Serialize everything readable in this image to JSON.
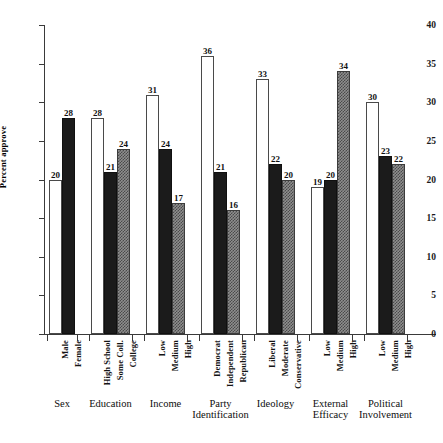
{
  "chart_data": {
    "type": "bar",
    "title": "",
    "xlabel": "",
    "ylabel": "Percent approve",
    "ylim": [
      0,
      40
    ],
    "ytick_labels": [
      "0",
      "5",
      "10",
      "15",
      "20",
      "25",
      "30",
      "35",
      "40"
    ],
    "ytick_values": [
      0,
      5,
      10,
      15,
      20,
      25,
      30,
      35,
      40
    ],
    "grid": false,
    "legend": "none",
    "bar_styles": [
      "white",
      "black",
      "gray"
    ],
    "groups": [
      {
        "name": "Sex",
        "title_lines": [
          "Sex"
        ],
        "categories": [
          "Male",
          "Female"
        ],
        "values": [
          20,
          28
        ],
        "styles": [
          "white",
          "black"
        ]
      },
      {
        "name": "Education",
        "title_lines": [
          "Education"
        ],
        "categories": [
          "High School",
          "Some Coll.",
          "College"
        ],
        "values": [
          28,
          21,
          24
        ],
        "styles": [
          "white",
          "black",
          "gray"
        ]
      },
      {
        "name": "Income",
        "title_lines": [
          "Income"
        ],
        "categories": [
          "Low",
          "Medium",
          "High"
        ],
        "values": [
          31,
          24,
          17
        ],
        "styles": [
          "white",
          "black",
          "gray"
        ]
      },
      {
        "name": "Party Identification",
        "title_lines": [
          "Party",
          "Identification"
        ],
        "categories": [
          "Democrat",
          "Independent",
          "Republican"
        ],
        "values": [
          36,
          21,
          16
        ],
        "styles": [
          "white",
          "black",
          "gray"
        ]
      },
      {
        "name": "Ideology",
        "title_lines": [
          "Ideology"
        ],
        "categories": [
          "Liberal",
          "Moderate",
          "Conservative"
        ],
        "values": [
          33,
          22,
          20
        ],
        "styles": [
          "white",
          "black",
          "gray"
        ]
      },
      {
        "name": "External Efficacy",
        "title_lines": [
          "External",
          "Efficacy"
        ],
        "categories": [
          "Low",
          "Medium",
          "High"
        ],
        "values": [
          19,
          20,
          34
        ],
        "styles": [
          "white",
          "black",
          "gray"
        ]
      },
      {
        "name": "Political Involvement",
        "title_lines": [
          "Political",
          "Involvement"
        ],
        "categories": [
          "Low",
          "Medium",
          "High"
        ],
        "values": [
          30,
          23,
          22
        ],
        "styles": [
          "white",
          "black",
          "gray"
        ]
      }
    ]
  }
}
